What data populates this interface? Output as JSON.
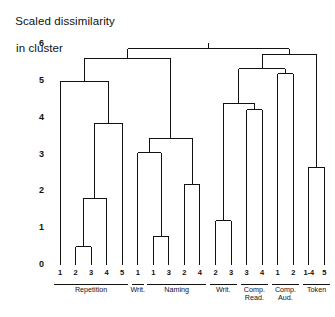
{
  "axis_title": {
    "line1": "Scaled dissimilarity",
    "line2": "in cluster"
  },
  "chart_data": {
    "type": "dendrogram",
    "title": "Scaled dissimilarity in cluster",
    "xlabel": "",
    "ylabel": "Scaled dissimilarity in cluster",
    "ylim": [
      0,
      6
    ],
    "yticks": [
      0,
      1,
      2,
      3,
      4,
      5,
      6
    ],
    "ytick_labels": [
      "0",
      "1",
      "2",
      "3",
      "4",
      "5",
      "6"
    ],
    "grid": false,
    "legend": "none",
    "orientation": "vertical",
    "leaf_labels": [
      "2",
      "3",
      "4",
      "5",
      "1",
      "1",
      "3",
      "2",
      "4",
      "2",
      "3",
      "3",
      "4",
      "1",
      "2",
      "1-4",
      "5"
    ],
    "leaves": [
      {
        "index": 0,
        "label": "1",
        "group": "Repetition"
      },
      {
        "index": 1,
        "label": "2",
        "group": "Repetition"
      },
      {
        "index": 2,
        "label": "3",
        "group": "Repetition"
      },
      {
        "index": 3,
        "label": "4",
        "group": "Repetition"
      },
      {
        "index": 4,
        "label": "5",
        "group": "Repetition"
      },
      {
        "index": 5,
        "label": "1",
        "group": "Writ."
      },
      {
        "index": 6,
        "label": "1",
        "group": "Naming"
      },
      {
        "index": 7,
        "label": "3",
        "group": "Naming"
      },
      {
        "index": 8,
        "label": "2",
        "group": "Naming"
      },
      {
        "index": 9,
        "label": "4",
        "group": "Naming"
      },
      {
        "index": 10,
        "label": "2",
        "group": "Writ."
      },
      {
        "index": 11,
        "label": "3",
        "group": "Writ."
      },
      {
        "index": 12,
        "label": "3",
        "group": "Comp. Read."
      },
      {
        "index": 13,
        "label": "4",
        "group": "Comp. Read."
      },
      {
        "index": 14,
        "label": "1",
        "group": "Comp. Aud."
      },
      {
        "index": 15,
        "label": "2",
        "group": "Comp. Aud."
      },
      {
        "index": 16,
        "label": "1-4",
        "group": "Token"
      },
      {
        "index": 17,
        "label": "5",
        "group": "Token"
      }
    ],
    "groups": [
      {
        "label": "Repetition",
        "leaf_start": 0,
        "leaf_end": 4
      },
      {
        "label": "Writ.",
        "leaf_start": 5,
        "leaf_end": 5
      },
      {
        "label": "Naming",
        "leaf_start": 6,
        "leaf_end": 9
      },
      {
        "label": "Writ.",
        "leaf_start": 10,
        "leaf_end": 11
      },
      {
        "label": "Comp.\nRead.",
        "leaf_start": 12,
        "leaf_end": 13
      },
      {
        "label": "Comp.\nAud.",
        "leaf_start": 14,
        "leaf_end": 15
      },
      {
        "label": "Token",
        "leaf_start": 16,
        "leaf_end": 17
      }
    ],
    "merges": [
      {
        "id": "m1",
        "left": "leaf:1",
        "right": "leaf:2",
        "height": 0.5
      },
      {
        "id": "m2",
        "left": "m1",
        "right": "leaf:3",
        "height": 1.8
      },
      {
        "id": "m3",
        "left": "m2",
        "right": "leaf:4",
        "height": 3.85
      },
      {
        "id": "m4",
        "left": "leaf:0",
        "right": "m3",
        "height": 5.0
      },
      {
        "id": "m5",
        "left": "leaf:6",
        "right": "leaf:7",
        "height": 0.78
      },
      {
        "id": "m6",
        "left": "leaf:5",
        "right": "m5",
        "height": 3.05
      },
      {
        "id": "m7",
        "left": "leaf:8",
        "right": "leaf:9",
        "height": 2.2
      },
      {
        "id": "m8",
        "left": "m6",
        "right": "m7",
        "height": 3.45
      },
      {
        "id": "m9",
        "left": "m4",
        "right": "m8",
        "height": 5.62
      },
      {
        "id": "m10",
        "left": "leaf:10",
        "right": "leaf:11",
        "height": 1.2
      },
      {
        "id": "m11",
        "left": "leaf:12",
        "right": "leaf:13",
        "height": 4.22
      },
      {
        "id": "m12",
        "left": "m10",
        "right": "m11",
        "height": 4.4
      },
      {
        "id": "m13",
        "left": "leaf:14",
        "right": "leaf:15",
        "height": 5.2
      },
      {
        "id": "m14",
        "left": "m12",
        "right": "m13",
        "height": 5.33
      },
      {
        "id": "m15",
        "left": "leaf:16",
        "right": "leaf:17",
        "height": 2.65
      },
      {
        "id": "m16",
        "left": "m14",
        "right": "m15",
        "height": 5.72
      },
      {
        "id": "m17",
        "left": "m9",
        "right": "m16",
        "height": 5.88
      }
    ]
  }
}
